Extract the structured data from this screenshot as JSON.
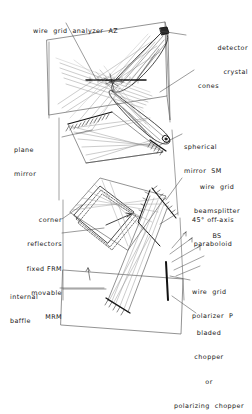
{
  "diagram": {
    "style": {
      "background": "#ffffff",
      "ink": "#1b1b1b",
      "ray_gray": "#8d8d8d",
      "faint_gray": "#b4b4b4",
      "enclosure": "#6e6e6e"
    },
    "labels": [
      {
        "id": "wire-grid-analyzer",
        "name": "wire-grid-analyzer-az",
        "lines": [
          "wire  grid  analyzer  AZ"
        ],
        "align": "left",
        "x": 33,
        "y": 11,
        "width": 150
      },
      {
        "id": "detector-crystal",
        "name": "detector-crystal",
        "lines": [
          "detector",
          "crystal"
        ],
        "align": "right",
        "x": 186,
        "y": 28,
        "width": 62
      },
      {
        "id": "cones",
        "name": "cones",
        "lines": [
          "cones"
        ],
        "align": "left",
        "x": 196,
        "y": 66,
        "width": 54
      },
      {
        "id": "plane-mirror",
        "name": "plane-mirror",
        "lines": [
          "plane",
          "mirror"
        ],
        "align": "left",
        "x": 14,
        "y": 130,
        "width": 48
      },
      {
        "id": "spherical-mirror",
        "name": "spherical-mirror-sm",
        "lines": [
          "spherical",
          "mirror  SM"
        ],
        "align": "left",
        "x": 184,
        "y": 127,
        "width": 66
      },
      {
        "id": "wire-grid-beamsplitter",
        "name": "wire-grid-beamsplitter-bs",
        "lines": [
          "wire  grid",
          "beamsplitter",
          "BS"
        ],
        "align": "center",
        "x": 184,
        "y": 167,
        "width": 66
      },
      {
        "id": "off-axis-paraboloid",
        "name": "off-axis-paraboloid",
        "lines": [
          "45° off-axis",
          "paraboloid"
        ],
        "align": "center",
        "x": 176,
        "y": 200,
        "width": 72
      },
      {
        "id": "corner-reflectors",
        "name": "corner-reflectors",
        "lines": [
          "corner",
          "reflectors",
          "fixed FRM",
          "movable",
          "MRM"
        ],
        "align": "right",
        "x": 6,
        "y": 200,
        "width": 56
      },
      {
        "id": "internal-baffle",
        "name": "internal-baffle",
        "lines": [
          "internal",
          "baffle"
        ],
        "align": "left",
        "x": 10,
        "y": 277,
        "width": 50
      },
      {
        "id": "wire-grid-polarizer",
        "name": "wire-grid-polarizer-p",
        "lines": [
          "wire  grid",
          "polarizer  P"
        ],
        "align": "left",
        "x": 192,
        "y": 272,
        "width": 60
      },
      {
        "id": "bladed-chopper",
        "name": "bladed-chopper",
        "lines": [
          "bladed",
          "chopper",
          "or",
          "polarizing  chopper"
        ],
        "align": "center",
        "x": 166,
        "y": 313,
        "width": 86
      }
    ],
    "components": [
      {
        "name": "detector-crystal",
        "kind": "crystal",
        "note": "small dark crystal at top right apex of upper cone"
      },
      {
        "name": "cones",
        "kind": "light-cone",
        "note": "two elongated tapered cones meeting near diagram centre"
      },
      {
        "name": "wire-grid-analyzer-az",
        "kind": "wire-grid",
        "note": "horizontal grid bar across the cone crossing point"
      },
      {
        "name": "plane-mirror",
        "kind": "flat-mirror",
        "note": "hatched flat mirror, upper-left of mid section"
      },
      {
        "name": "spherical-mirror-sm",
        "kind": "curved-mirror",
        "note": "hatched mirror on right of mid section"
      },
      {
        "name": "wire-grid-beamsplitter-bs",
        "kind": "beamsplitter",
        "note": "angled grid plate centre-right"
      },
      {
        "name": "off-axis-paraboloid",
        "kind": "paraboloid",
        "note": "45 degree off-axis paraboloid, right side"
      },
      {
        "name": "corner-reflector-frm",
        "kind": "retroreflector",
        "note": "fixed corner reflector, dashed outline diamond"
      },
      {
        "name": "corner-reflector-mrm",
        "kind": "retroreflector",
        "note": "movable corner reflector with travel arrow"
      },
      {
        "name": "internal-baffle",
        "kind": "baffle",
        "note": "straight baffle line inside lower enclosure"
      },
      {
        "name": "wire-grid-polarizer-p",
        "kind": "wire-grid",
        "note": "thick vertical bar lower right"
      },
      {
        "name": "bladed-chopper",
        "kind": "chopper",
        "note": "chopper at bottom of optical train"
      }
    ]
  }
}
